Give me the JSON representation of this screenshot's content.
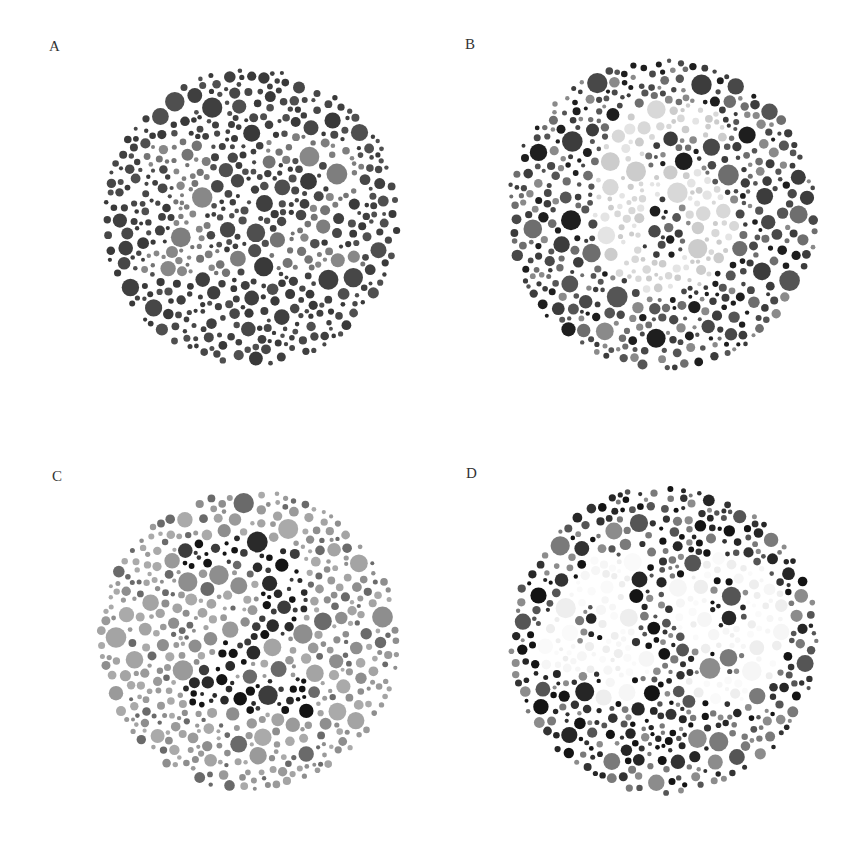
{
  "figure": {
    "width": 860,
    "height": 843,
    "background": "#ffffff"
  },
  "plates": [
    {
      "label": "A",
      "label_pos": [
        49,
        39
      ],
      "center": [
        251,
        217
      ],
      "radius": 150,
      "hidden_figure": "12",
      "figure_colors": [
        "#7e7e7e",
        "#888888",
        "#747474"
      ],
      "background_colors": [
        "#3f3f3f",
        "#474747",
        "#4f4f4f",
        "#393939"
      ],
      "seed": 11
    },
    {
      "label": "B",
      "label_pos": [
        465,
        37
      ],
      "center": [
        662,
        214
      ],
      "radius": 157,
      "hidden_figure": "6",
      "figure_colors": [
        "#d8d8d8",
        "#e4e4e4",
        "#cccccc"
      ],
      "background_colors": [
        "#1e1e1e",
        "#3c3c3c",
        "#555555",
        "#6e6e6e",
        "#8a8a8a",
        "#484848"
      ],
      "seed": 23
    },
    {
      "label": "C",
      "label_pos": [
        52,
        469
      ],
      "center": [
        248,
        640
      ],
      "radius": 152,
      "hidden_figure": "2",
      "figure_colors": [
        "#141414",
        "#2a2a2a",
        "#3c3c3c"
      ],
      "background_colors": [
        "#9a9a9a",
        "#a4a4a4",
        "#8e8e8e",
        "#aaaaaa",
        "#6a6a6a"
      ],
      "seed": 37
    },
    {
      "label": "D",
      "label_pos": [
        466,
        466
      ],
      "center": [
        664,
        640
      ],
      "radius": 156,
      "hidden_figure": "49",
      "figure_colors": [
        "#f6f6f6",
        "#eeeeee",
        "#fafafa"
      ],
      "background_colors": [
        "#141414",
        "#333333",
        "#555555",
        "#7a7a7a",
        "#8c8c8c",
        "#262626"
      ],
      "seed": 53
    }
  ]
}
